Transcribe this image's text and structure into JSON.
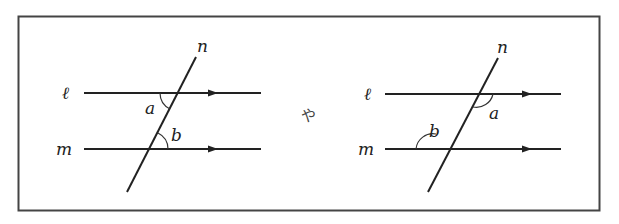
{
  "figure": {
    "left_diagram": {
      "labels": {
        "l": "ℓ",
        "m": "m",
        "n": "n",
        "a": "a",
        "b": "b"
      },
      "description": "Parallel lines ℓ and m cut by transversal n; angle a below ℓ on left of n, angle b above m on right of n (alternate interior angles)"
    },
    "separator": "や",
    "right_diagram": {
      "labels": {
        "l": "ℓ",
        "m": "m",
        "n": "n",
        "a": "a",
        "b": "b"
      },
      "description": "Parallel lines ℓ and m cut by transversal n; angle a below ℓ on right of n, angle b above m on left of n (alternate interior angles)"
    },
    "colors": {
      "stroke": "#222222",
      "frame": "#444444",
      "background": "#ffffff"
    }
  }
}
